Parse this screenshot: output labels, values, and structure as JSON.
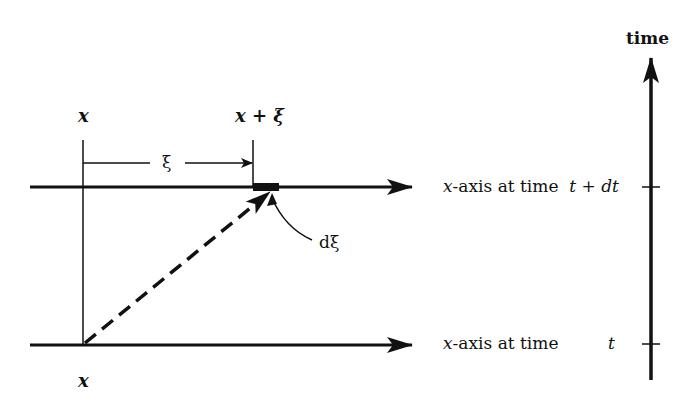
{
  "labels": {
    "x_top": "x",
    "x_plus_xi": "x + ξ",
    "xi": "ξ",
    "dxi": "dξ",
    "x_bottom": "x",
    "axis_top_prefix": "x",
    "axis_top_text": "-axis at time",
    "axis_top_time": "t + dt",
    "axis_bottom_prefix": "x",
    "axis_bottom_text": "-axis at time",
    "axis_bottom_time": "t",
    "time_axis": "time"
  },
  "colors": {
    "ink": "#111111",
    "background": "#ffffff"
  }
}
